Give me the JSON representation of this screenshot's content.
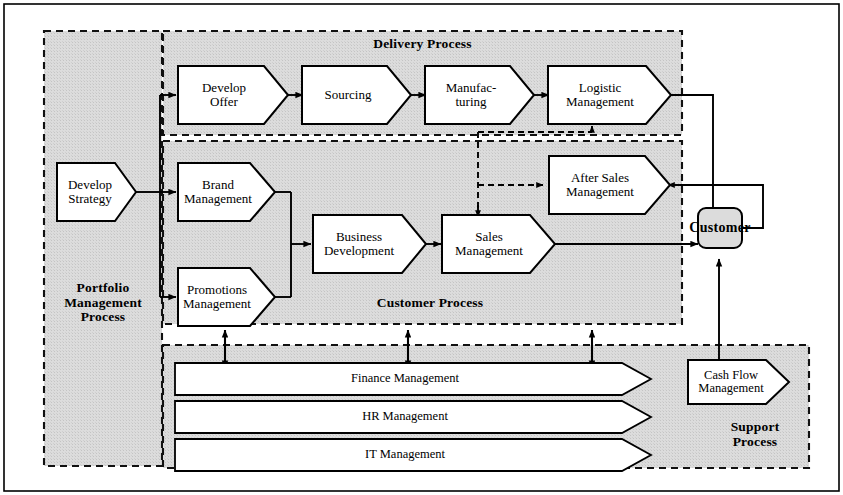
{
  "diagram": {
    "colors": {
      "shade": "#d9d9d9",
      "shape_fill": "#ffffff",
      "stroke": "#000000",
      "outer_border": "#000000"
    },
    "groups": [
      {
        "id": "portfolio",
        "label": "Portfolio\nManagement\nProcess",
        "label_lines": [
          "Portfolio",
          "Management",
          "Process"
        ]
      },
      {
        "id": "delivery",
        "label": "Delivery Process",
        "label_lines": [
          "Delivery Process"
        ]
      },
      {
        "id": "customer",
        "label": "Customer Process",
        "label_lines": [
          "Customer Process"
        ]
      },
      {
        "id": "support",
        "label": "Support Process",
        "label_lines": [
          "Support",
          "Process"
        ]
      }
    ],
    "nodes": {
      "develop_strategy": {
        "label_lines": [
          "Develop",
          "Strategy"
        ],
        "shape": "chevron",
        "group": "portfolio"
      },
      "develop_offer": {
        "label_lines": [
          "Develop",
          "Offer"
        ],
        "shape": "chevron",
        "group": "delivery"
      },
      "sourcing": {
        "label_lines": [
          "Sourcing"
        ],
        "shape": "chevron",
        "group": "delivery"
      },
      "manufacturing": {
        "label_lines": [
          "Manufac-",
          "turing"
        ],
        "shape": "chevron",
        "group": "delivery"
      },
      "logistic_management": {
        "label_lines": [
          "Logistic",
          "Management"
        ],
        "shape": "chevron",
        "group": "delivery"
      },
      "brand_management": {
        "label_lines": [
          "Brand",
          "Management"
        ],
        "shape": "chevron",
        "group": "customer"
      },
      "promotions_management": {
        "label_lines": [
          "Promotions",
          "Management"
        ],
        "shape": "chevron",
        "group": "customer"
      },
      "business_development": {
        "label_lines": [
          "Business",
          "Development"
        ],
        "shape": "chevron",
        "group": "customer"
      },
      "sales_management": {
        "label_lines": [
          "Sales",
          "Management"
        ],
        "shape": "chevron",
        "group": "customer"
      },
      "after_sales_management": {
        "label_lines": [
          "After Sales",
          "Management"
        ],
        "shape": "chevron",
        "group": "customer"
      },
      "cash_flow_management": {
        "label_lines": [
          "Cash Flow",
          "Management"
        ],
        "shape": "chevron",
        "group": "support"
      },
      "finance_management": {
        "label_lines": [
          "Finance Management"
        ],
        "shape": "wide-chevron",
        "group": "support"
      },
      "hr_management": {
        "label_lines": [
          "HR Management"
        ],
        "shape": "wide-chevron",
        "group": "support"
      },
      "it_management": {
        "label_lines": [
          "IT Management"
        ],
        "shape": "wide-chevron",
        "group": "support"
      },
      "customer": {
        "label_lines": [
          "Customer"
        ],
        "shape": "rounded-rect",
        "group": "none"
      }
    },
    "labels": {
      "develop_strategy": "Develop Strategy",
      "develop_offer": "Develop Offer",
      "sourcing": "Sourcing",
      "manufacturing": "Manufac-turing",
      "logistic_management": "Logistic Management",
      "brand_management": "Brand Management",
      "promotions_management": "Promotions Management",
      "business_development": "Business Development",
      "sales_management": "Sales Management",
      "after_sales_management": "After Sales Management",
      "cash_flow_management": "Cash Flow Management",
      "finance_management": "Finance Management",
      "hr_management": "HR Management",
      "it_management": "IT Management",
      "customer": "Customer",
      "portfolio_group": "Portfolio Management Process",
      "delivery_group": "Delivery Process",
      "customer_group": "Customer Process",
      "support_group": "Support Process"
    },
    "text": {
      "portfolio_l1": "Portfolio",
      "portfolio_l2": "Management",
      "portfolio_l3": "Process",
      "delivery_title": "Delivery Process",
      "customer_title": "Customer Process",
      "support_l1": "Support",
      "support_l2": "Process",
      "develop_strategy_l1": "Develop",
      "develop_strategy_l2": "Strategy",
      "develop_offer_l1": "Develop",
      "develop_offer_l2": "Offer",
      "sourcing_l1": "Sourcing",
      "manufacturing_l1": "Manufac-",
      "manufacturing_l2": "turing",
      "logistic_l1": "Logistic",
      "logistic_l2": "Management",
      "brand_l1": "Brand",
      "brand_l2": "Management",
      "promotions_l1": "Promotions",
      "promotions_l2": "Management",
      "busdev_l1": "Business",
      "busdev_l2": "Development",
      "sales_l1": "Sales",
      "sales_l2": "Management",
      "aftersales_l1": "After Sales",
      "aftersales_l2": "Management",
      "cashflow_l1": "Cash Flow",
      "cashflow_l2": "Management",
      "finance": "Finance Management",
      "hr": "HR Management",
      "it": "IT Management",
      "customer": "Customer"
    },
    "connections": [
      {
        "from": "develop_strategy",
        "to": "develop_offer",
        "style": "solid",
        "arrow": "single"
      },
      {
        "from": "develop_strategy",
        "to": "brand_management",
        "style": "solid",
        "arrow": "single"
      },
      {
        "from": "develop_strategy",
        "to": "promotions_management",
        "style": "solid",
        "arrow": "single"
      },
      {
        "from": "develop_offer",
        "to": "sourcing",
        "style": "solid",
        "arrow": "single"
      },
      {
        "from": "sourcing",
        "to": "manufacturing",
        "style": "solid",
        "arrow": "single"
      },
      {
        "from": "manufacturing",
        "to": "logistic_management",
        "style": "solid",
        "arrow": "single"
      },
      {
        "from": "logistic_management",
        "to": "customer",
        "style": "solid",
        "arrow": "single"
      },
      {
        "from": "brand_management",
        "to": "business_development",
        "style": "solid",
        "arrow": "single"
      },
      {
        "from": "promotions_management",
        "to": "business_development",
        "style": "solid",
        "arrow": "single"
      },
      {
        "from": "business_development",
        "to": "sales_management",
        "style": "solid",
        "arrow": "single"
      },
      {
        "from": "sales_management",
        "to": "customer",
        "style": "solid",
        "arrow": "single"
      },
      {
        "from": "customer",
        "to": "after_sales_management",
        "style": "solid",
        "arrow": "single"
      },
      {
        "from": "after_sales_management",
        "to": "logistic_management",
        "style": "dashed",
        "arrow": "single"
      },
      {
        "from": "after_sales_management",
        "to": "sales_management",
        "style": "dashed",
        "arrow": "single"
      },
      {
        "from": "cash_flow_management",
        "to": "customer",
        "style": "solid",
        "arrow": "single"
      },
      {
        "from": "customer_process",
        "to": "support_process",
        "style": "solid",
        "arrow": "double"
      },
      {
        "from": "customer_process",
        "to": "support_process",
        "style": "solid",
        "arrow": "double"
      },
      {
        "from": "customer_process",
        "to": "support_process",
        "style": "solid",
        "arrow": "double"
      }
    ]
  }
}
